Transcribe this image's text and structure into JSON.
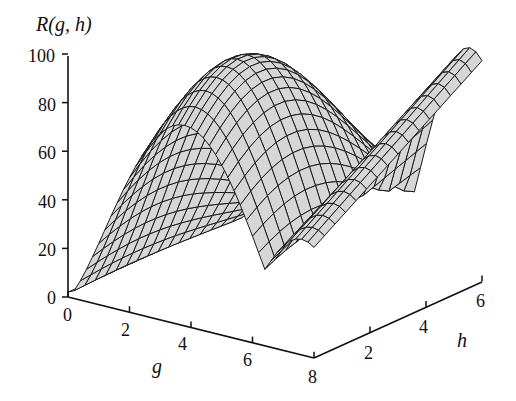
{
  "chart_data": {
    "type": "surface3d",
    "title": "",
    "zlabel": "R(g, h)",
    "xlabel": "g",
    "ylabel": "h",
    "x_ticks": [
      "0",
      "2",
      "4",
      "6",
      "8"
    ],
    "y_ticks": [
      "2",
      "4",
      "6"
    ],
    "z_ticks": [
      "0",
      "20",
      "40",
      "60",
      "80",
      "100"
    ],
    "xlim": [
      0,
      8
    ],
    "ylim": [
      0,
      6
    ],
    "zlim": [
      0,
      100
    ],
    "grid_lines_g": 40,
    "grid_lines_h": 16,
    "surface_fill": "#d6d6d6",
    "line_color": "#1a1a1a",
    "sample_points": [
      {
        "g": 0,
        "h": 0,
        "R": 0
      },
      {
        "g": 3,
        "h": 2,
        "R": 100
      },
      {
        "g": 6,
        "h": 1,
        "R": 5
      },
      {
        "g": 8,
        "h": 6,
        "R": 75
      },
      {
        "g": 7,
        "h": 3,
        "R": 95
      }
    ]
  }
}
